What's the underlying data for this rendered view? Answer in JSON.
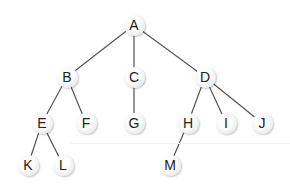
{
  "diagram": {
    "type": "tree",
    "colors": {
      "edge": "#555555",
      "node_fill": "#ffffff",
      "node_text": "#222222",
      "background": "#ffffff"
    },
    "nodes": [
      {
        "id": "A",
        "label": "A",
        "x": 134,
        "y": 25
      },
      {
        "id": "B",
        "label": "B",
        "x": 67,
        "y": 77
      },
      {
        "id": "C",
        "label": "C",
        "x": 134,
        "y": 77
      },
      {
        "id": "D",
        "label": "D",
        "x": 205,
        "y": 77
      },
      {
        "id": "E",
        "label": "E",
        "x": 42,
        "y": 123
      },
      {
        "id": "F",
        "label": "F",
        "x": 86,
        "y": 123
      },
      {
        "id": "G",
        "label": "G",
        "x": 134,
        "y": 123
      },
      {
        "id": "H",
        "label": "H",
        "x": 188,
        "y": 123
      },
      {
        "id": "I",
        "label": "I",
        "x": 226,
        "y": 123
      },
      {
        "id": "J",
        "label": "J",
        "x": 262,
        "y": 123
      },
      {
        "id": "K",
        "label": "K",
        "x": 28,
        "y": 165
      },
      {
        "id": "L",
        "label": "L",
        "x": 63,
        "y": 165
      },
      {
        "id": "M",
        "label": "M",
        "x": 170,
        "y": 165
      }
    ],
    "edges": [
      {
        "from": "A",
        "to": "B"
      },
      {
        "from": "A",
        "to": "C"
      },
      {
        "from": "A",
        "to": "D"
      },
      {
        "from": "B",
        "to": "E"
      },
      {
        "from": "B",
        "to": "F"
      },
      {
        "from": "C",
        "to": "G"
      },
      {
        "from": "D",
        "to": "H"
      },
      {
        "from": "D",
        "to": "I"
      },
      {
        "from": "D",
        "to": "J"
      },
      {
        "from": "E",
        "to": "K"
      },
      {
        "from": "E",
        "to": "L"
      },
      {
        "from": "H",
        "to": "M"
      }
    ]
  }
}
